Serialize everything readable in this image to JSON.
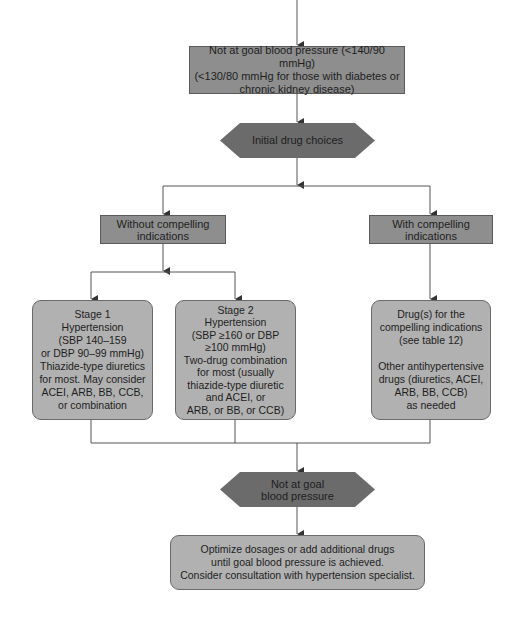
{
  "colors": {
    "rect_fill": "#8e8e8e",
    "round_fill": "#b1b1b1",
    "hex_fill": "#6b6b6b",
    "line": "#555555"
  },
  "nodes": {
    "top_box": {
      "lines": [
        "Not at goal blood pressure (<140/90 mmHg)",
        "(<130/80 mmHg for those with diabetes or",
        "chronic kidney disease)"
      ]
    },
    "initial_choices": {
      "lines": [
        "Initial drug choices"
      ]
    },
    "without_compelling": {
      "lines": [
        "Without compelling",
        "indications"
      ]
    },
    "with_compelling": {
      "lines": [
        "With compelling",
        "indications"
      ]
    },
    "stage1": {
      "lines": [
        "Stage 1",
        "Hypertension",
        "(SBP 140–159",
        "or DBP 90–99 mmHg)",
        "Thiazide-type diuretics",
        "for most. May consider",
        "ACEI, ARB, BB, CCB,",
        "or combination"
      ]
    },
    "stage2": {
      "lines": [
        "Stage 2",
        "Hypertension",
        "(SBP ≥160 or DBP",
        "≥100 mmHg)",
        "Two-drug combination",
        "for most (usually",
        "thiazide-type diuretic",
        "and ACEI, or",
        "ARB, or BB, or CCB)"
      ]
    },
    "compelling_drugs": {
      "lines": [
        "Drug(s) for the",
        "compelling indications",
        "(see table 12)",
        "",
        "Other antihypertensive",
        "drugs (diuretics, ACEI,",
        "ARB, BB, CCB)",
        "as needed"
      ]
    },
    "not_at_goal": {
      "lines": [
        "Not at goal",
        "blood pressure"
      ]
    },
    "optimize": {
      "lines": [
        "Optimize dosages or add additional drugs",
        "until goal blood pressure is achieved.",
        "Consider consultation with hypertension specialist."
      ]
    }
  }
}
